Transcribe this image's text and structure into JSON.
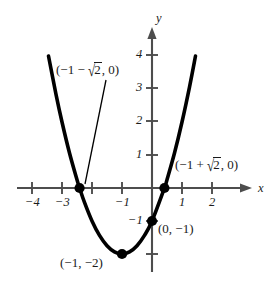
{
  "chart_data": {
    "type": "line",
    "title": "",
    "xlabel": "x",
    "ylabel": "y",
    "equation": "y = x^2 + 2x - 1",
    "xlim": [
      -4.6,
      2.6
    ],
    "ylim": [
      -2.9,
      4.8
    ],
    "grid": false,
    "legend": null,
    "x_ticks": [
      {
        "value": -4,
        "label": "−4"
      },
      {
        "value": -3,
        "label": "−3"
      },
      {
        "value": -2,
        "label": ""
      },
      {
        "value": -1,
        "label": "−1"
      },
      {
        "value": 1,
        "label": "1"
      },
      {
        "value": 2,
        "label": "2"
      }
    ],
    "y_ticks": [
      {
        "value": 4,
        "label": "4"
      },
      {
        "value": 3,
        "label": "3"
      },
      {
        "value": 2,
        "label": "2"
      },
      {
        "value": 1,
        "label": "1"
      },
      {
        "value": -1,
        "label": "−1"
      },
      {
        "value": -2,
        "label": ""
      }
    ],
    "curve_points": [
      {
        "x": -3.45,
        "y": 4.0
      },
      {
        "x": -3.2,
        "y": 2.84
      },
      {
        "x": -3.0,
        "y": 2.0
      },
      {
        "x": -2.75,
        "y": 1.06
      },
      {
        "x": -2.5,
        "y": 0.25
      },
      {
        "x": -2.4142,
        "y": 0.0
      },
      {
        "x": -2.25,
        "y": -0.4375
      },
      {
        "x": -2.0,
        "y": -1.0
      },
      {
        "x": -1.75,
        "y": -1.4375
      },
      {
        "x": -1.5,
        "y": -1.75
      },
      {
        "x": -1.25,
        "y": -1.9375
      },
      {
        "x": -1.0,
        "y": -2.0
      },
      {
        "x": -0.75,
        "y": -1.9375
      },
      {
        "x": -0.5,
        "y": -1.75
      },
      {
        "x": -0.25,
        "y": -1.4375
      },
      {
        "x": 0.0,
        "y": -1.0
      },
      {
        "x": 0.4142,
        "y": 0.0
      },
      {
        "x": 0.5,
        "y": 0.25
      },
      {
        "x": 0.75,
        "y": 1.06
      },
      {
        "x": 1.0,
        "y": 2.0
      },
      {
        "x": 1.25,
        "y": 3.06
      },
      {
        "x": 1.45,
        "y": 4.0
      }
    ],
    "marked_points": [
      {
        "id": "left-root",
        "x": -2.4142,
        "y": 0,
        "label": "(−1 − √2, 0)"
      },
      {
        "id": "right-root",
        "x": 0.4142,
        "y": 0,
        "label": "(−1 + √2, 0)"
      },
      {
        "id": "y-intercept",
        "x": 0,
        "y": -1,
        "label": "(0, −1)"
      },
      {
        "id": "vertex",
        "x": -1,
        "y": -2,
        "label": "(−1, −2)"
      }
    ],
    "colors": {
      "curve": "#000000",
      "axis": "#4d4d4d",
      "text": "#1a1a1a",
      "background": "#ffffff",
      "point": "#000000"
    }
  },
  "labels": {
    "axis_x": "x",
    "axis_y": "y",
    "left_root": {
      "open": "(−1 − ",
      "radicand": "2",
      "close": ", 0)"
    },
    "right_root": {
      "open": "(−1 + ",
      "radicand": "2",
      "close": ", 0)"
    },
    "y_intercept": "(0, −1)",
    "vertex": "(−1, −2)",
    "tick_x_neg4": "−4",
    "tick_x_neg3": "−3",
    "tick_x_neg1": "−1",
    "tick_x_1": "1",
    "tick_x_2": "2",
    "tick_y_4": "4",
    "tick_y_3": "3",
    "tick_y_2": "2",
    "tick_y_1": "1",
    "tick_y_neg1": "−1"
  }
}
